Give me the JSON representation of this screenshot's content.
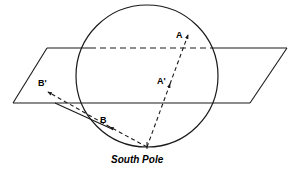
{
  "figure": {
    "title": "",
    "caption": "South Pole",
    "stroke_color": "#1a1a1a",
    "background_color": "#ffffff",
    "labels": {
      "a": "A",
      "a_prime": "A'",
      "b": "B",
      "b_prime": "B'",
      "south_pole": "South Pole"
    },
    "geometry": {
      "sphere": {
        "center_x": 147,
        "center_y": 76,
        "radius": 71
      },
      "plane": {
        "top_left_x": 47,
        "top_left_y": 48,
        "top_right_x": 287,
        "top_right_y": 48,
        "bottom_right_x": 250,
        "bottom_right_y": 103,
        "bottom_left_x": 13,
        "bottom_left_y": 103
      },
      "points": {
        "A": {
          "x": 188,
          "y": 34
        },
        "A_prime": {
          "x": 172,
          "y": 83
        },
        "B": {
          "x": 106,
          "y": 125
        },
        "B_prime": {
          "x": 45,
          "y": 90
        },
        "south_pole": {
          "x": 147,
          "y": 147
        }
      }
    }
  }
}
